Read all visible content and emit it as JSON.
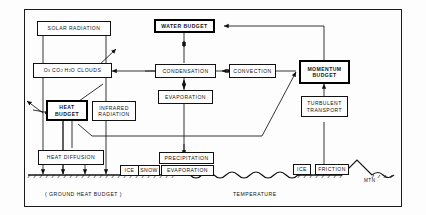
{
  "diagram": {
    "boxes": {
      "solar_radiation": "SOLAR RADIATION",
      "gases_clouds_parts": {
        "o3": "O",
        "o3sub": "3",
        "co2": "CO",
        "co2sub": "2",
        "h2o": "H",
        "h2osub": "2",
        "h2o_rest": "O",
        "clouds": "CLOUDS"
      },
      "gases_clouds_plain": "O3 CO2 H2O CLOUDS",
      "heat_budget": "HEAT BUDGET",
      "heat_budget_l1": "HEAT",
      "heat_budget_l2": "BUDGET",
      "infrared_radiation_l1": "INFRARED",
      "infrared_radiation_l2": "RADIATION",
      "heat_diffusion": "HEAT DIFFUSION",
      "water_budget": "WATER BUDGET",
      "condensation": "CONDENSATION",
      "evaporation_upper": "EVAPORATION",
      "precipitation": "PRECIPITATION",
      "ice_left": "ICE",
      "snow": "SNOW",
      "evaporation_lower": "EVAPORATION",
      "convection": "CONVECTION",
      "momentum_budget_l1": "MOMENTUM",
      "momentum_budget_l2": "BUDGET",
      "turbulent_transport_l1": "TURBULENT",
      "turbulent_transport_l2": "TRANSPORT",
      "ice_right": "ICE",
      "friction": "FRICTION"
    },
    "labels": {
      "ground_heat_budget": "( GROUND  HEAT  BUDGET )",
      "temperature": "TEMPERATURE",
      "mountain": "MTN"
    },
    "colors": {
      "ink": "#111111",
      "paper": "#fdfdfd",
      "emphasis_border": "#000000"
    }
  }
}
